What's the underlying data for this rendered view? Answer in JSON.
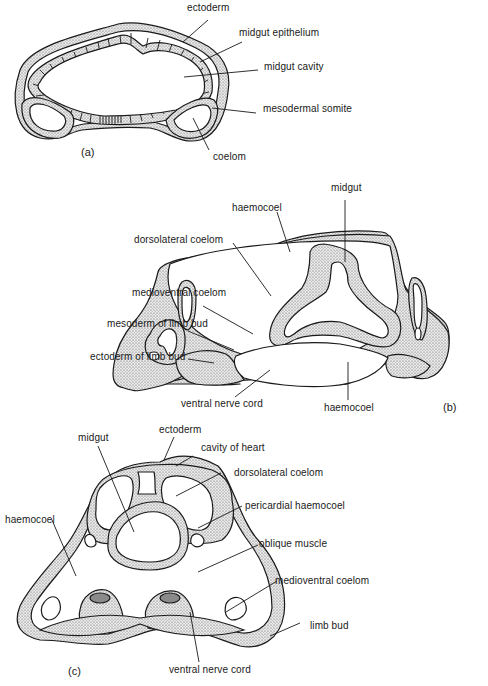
{
  "figure": {
    "panels": [
      {
        "id": "a",
        "label": "(a)",
        "labels": {
          "ectoderm": "ectoderm",
          "midgut_epithelium": "midgut epithelium",
          "midgut_cavity": "midgut cavity",
          "mesodermal_somite": "mesodermal somite",
          "coelom": "coelom"
        }
      },
      {
        "id": "b",
        "label": "(b)",
        "labels": {
          "midgut": "midgut",
          "haemocoel_top": "haemocoel",
          "dorsolateral_coelom": "dorsolateral coelom",
          "medioventral_coelom": "medioventral coelom",
          "mesoderm_of_limb_bud": "mesoderm of limb bud",
          "ectoderm_of_limb_bud": "ectoderm of limb bud",
          "ventral_nerve_cord": "ventral nerve cord",
          "haemocoel_bottom": "haemocoel"
        }
      },
      {
        "id": "c",
        "label": "(c)",
        "labels": {
          "midgut": "midgut",
          "ectoderm": "ectoderm",
          "cavity_of_heart": "cavity of heart",
          "dorsolateral_coelom": "dorsolateral coelom",
          "pericardial_haemocoel": "pericardial haemocoel",
          "haemocoel": "haemocoel",
          "oblique_muscle": "oblique muscle",
          "medioventral_coelom": "medioventral coelom",
          "limb_bud": "limb bud",
          "ventral_nerve_cord": "ventral nerve cord"
        }
      }
    ]
  }
}
